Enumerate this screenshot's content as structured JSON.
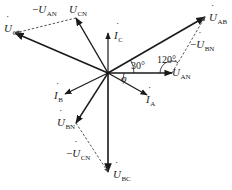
{
  "diagram": {
    "type": "phasor-diagram",
    "origin": [
      108,
      73
    ],
    "colors": {
      "line": "#1a1a1a",
      "dashed": "#444444",
      "background": "#ffffff"
    },
    "vectors": [
      {
        "id": "U_AB",
        "symbol": "U",
        "sub": "AB",
        "prefix": "",
        "end": [
          205,
          17
        ],
        "style": "solid",
        "width": 1.6
      },
      {
        "id": "U_AN",
        "symbol": "U",
        "sub": "AN",
        "prefix": "",
        "end": [
          172,
          73
        ],
        "style": "solid",
        "width": 1.4
      },
      {
        "id": "U_CN",
        "symbol": "U",
        "sub": "CN",
        "prefix": "",
        "end": [
          76,
          18
        ],
        "style": "solid",
        "width": 1.4
      },
      {
        "id": "U_CA",
        "symbol": "U",
        "sub": "CA",
        "prefix": "",
        "end": [
          15,
          33
        ],
        "style": "solid",
        "width": 1.6
      },
      {
        "id": "U_BN",
        "symbol": "U",
        "sub": "BN",
        "prefix": "",
        "end": [
          76,
          123
        ],
        "style": "solid",
        "width": 1.4
      },
      {
        "id": "U_BC",
        "symbol": "U",
        "sub": "BC",
        "prefix": "",
        "end": [
          108,
          172
        ],
        "style": "solid",
        "width": 1.6
      },
      {
        "id": "I_A",
        "symbol": "I",
        "sub": "A",
        "prefix": "",
        "end": [
          147,
          95
        ],
        "style": "solid",
        "width": 1.2
      },
      {
        "id": "I_B",
        "symbol": "I",
        "sub": "B",
        "prefix": "",
        "end": [
          65,
          94
        ],
        "style": "solid",
        "width": 1.2
      },
      {
        "id": "I_C",
        "symbol": "I",
        "sub": "C",
        "prefix": "",
        "end": [
          108,
          33
        ],
        "style": "solid",
        "width": 1.2
      }
    ],
    "dashed_vectors": [
      {
        "id": "neg_U_AN",
        "from": [
          76,
          18
        ],
        "to": [
          15,
          33
        ],
        "label": "-U_AN"
      },
      {
        "id": "neg_U_BN",
        "from": [
          172,
          73
        ],
        "to": [
          205,
          17
        ],
        "label": "-U_BN"
      },
      {
        "id": "neg_U_CN",
        "from": [
          76,
          123
        ],
        "to": [
          108,
          172
        ],
        "label": "-U_CN"
      }
    ],
    "labels": [
      {
        "id": "lbl-U_AB",
        "prefix": "",
        "symbol": "U",
        "sub": "AB",
        "x": 209,
        "y": 12
      },
      {
        "id": "lbl-neg-U_BN",
        "prefix": "−",
        "symbol": "U",
        "sub": "BN",
        "x": 190,
        "y": 39
      },
      {
        "id": "lbl-U_AN",
        "prefix": "",
        "symbol": "U",
        "sub": "AN",
        "x": 172,
        "y": 67
      },
      {
        "id": "lbl-U_CN",
        "prefix": "",
        "symbol": "U",
        "sub": "CN",
        "x": 69,
        "y": 4
      },
      {
        "id": "lbl-neg-U_AN",
        "prefix": "−",
        "symbol": "U",
        "sub": "AN",
        "x": 32,
        "y": 4
      },
      {
        "id": "lbl-U_CA",
        "prefix": "",
        "symbol": "U",
        "sub": "CA",
        "x": 4,
        "y": 23
      },
      {
        "id": "lbl-I_C",
        "prefix": "",
        "symbol": "I",
        "sub": "C",
        "x": 114,
        "y": 30
      },
      {
        "id": "lbl-I_B",
        "prefix": "",
        "symbol": "I",
        "sub": "B",
        "x": 54,
        "y": 90
      },
      {
        "id": "lbl-I_A",
        "prefix": "",
        "symbol": "I",
        "sub": "A",
        "x": 146,
        "y": 94
      },
      {
        "id": "lbl-U_BN",
        "prefix": "",
        "symbol": "U",
        "sub": "BN",
        "x": 57,
        "y": 117
      },
      {
        "id": "lbl-neg-U_CN",
        "prefix": "−",
        "symbol": "U",
        "sub": "CN",
        "x": 66,
        "y": 148
      },
      {
        "id": "lbl-U_BC",
        "prefix": "",
        "symbol": "U",
        "sub": "BC",
        "x": 113,
        "y": 169
      }
    ],
    "angles": [
      {
        "id": "angle-30",
        "text": "30°",
        "x": 131,
        "y": 60
      },
      {
        "id": "angle-120",
        "text": "120°",
        "x": 157,
        "y": 54
      },
      {
        "id": "angle-phi",
        "text": "φ",
        "x": 121,
        "y": 73
      }
    ],
    "arcs": [
      {
        "id": "arc-30",
        "cx": 108,
        "cy": 73,
        "r": 26,
        "start_deg": 0,
        "end_deg": -30
      },
      {
        "id": "arc-120",
        "cx": 172,
        "cy": 73,
        "r": 12,
        "start_deg": 180,
        "end_deg": 300
      },
      {
        "id": "arc-phi",
        "cx": 108,
        "cy": 73,
        "r": 16,
        "start_deg": 0,
        "end_deg": 30
      }
    ]
  }
}
